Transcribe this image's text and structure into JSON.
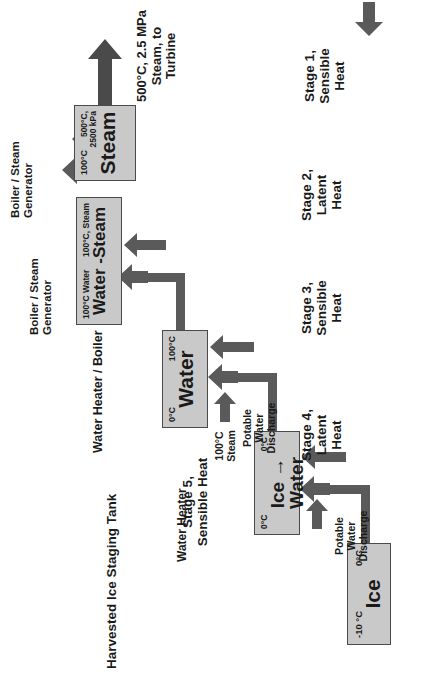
{
  "diagram": {
    "colors": {
      "node_fill": "#c9c9c9",
      "node_border": "#4a4a4a",
      "arrow": "#5a5a5a",
      "text": "#1a1a1a"
    },
    "nodes": [
      {
        "id": "ice",
        "header": "Harvested Ice Staging Tank",
        "phase": "Ice",
        "temp_in": "-10 °C",
        "temp_out": "0°C"
      },
      {
        "id": "ice-water",
        "header": "Water Heater",
        "phase": "Ice → Water",
        "temp_in": "0°C",
        "temp_out": "0°C"
      },
      {
        "id": "water",
        "header": "Water Heater / Boiler",
        "phase": "Water",
        "temp_in": "0°C",
        "temp_out": "100°C"
      },
      {
        "id": "water-steam",
        "header": "Boiler / Steam\nGenerator",
        "phase": "Water -Steam",
        "temp_in": "100°C Water",
        "temp_out": "100°C, Steam"
      },
      {
        "id": "steam",
        "header": "Boiler / Steam\nGenerator",
        "phase": "Steam",
        "temp_in": "100°C",
        "temp_out": "500°C,\n2500 kPa"
      }
    ],
    "stages": [
      {
        "id": "stage1",
        "label": "Stage 1,\nSensible\nHeat"
      },
      {
        "id": "stage2",
        "label": "Stage 2,\nLatent\nHeat"
      },
      {
        "id": "stage3",
        "label": "Stage 3,\nSensible\nHeat"
      },
      {
        "id": "stage4",
        "label": "Stage 4,\nLatent\nHeat"
      },
      {
        "id": "stage5",
        "label": "Stage 5,\nSensible Heat"
      }
    ],
    "discharges": [
      {
        "id": "discharge1",
        "label": "Potable\nWater\nDischarge"
      },
      {
        "id": "discharge2",
        "label": "Potable\nWater\nDischarge"
      }
    ],
    "stream_labels": [
      {
        "id": "steam-100",
        "label": "100°C\nSteam"
      }
    ],
    "output": {
      "label": "500°C, 2.5 MPa\nSteam, to\nTurbine"
    }
  }
}
